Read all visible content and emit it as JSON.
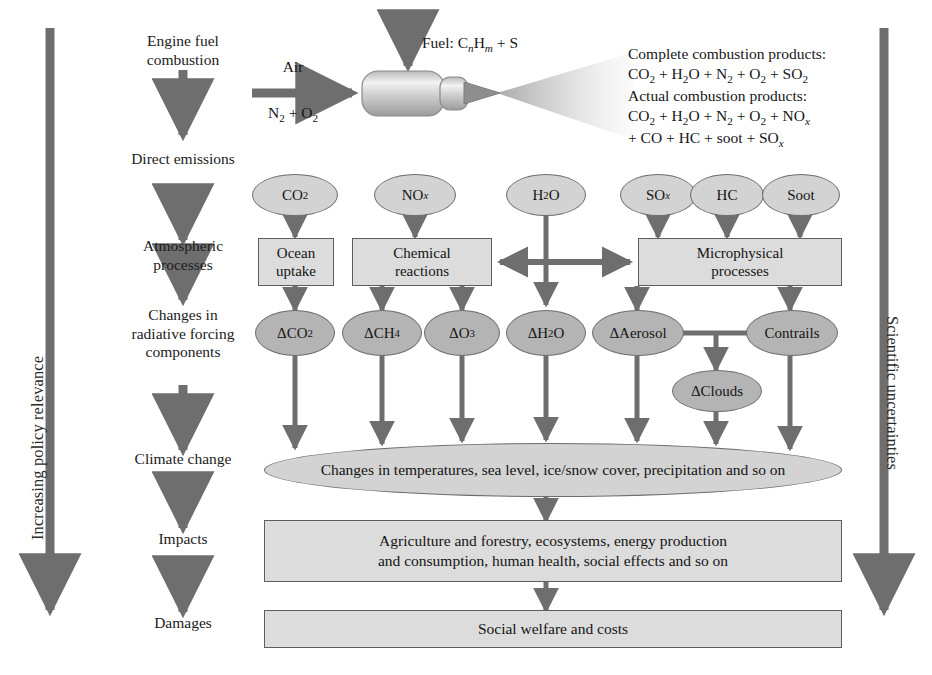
{
  "diagram": {
    "title_rails": {
      "left": "Increasing policy relevance",
      "right": "Scientific uncertainties"
    },
    "stages": [
      {
        "id": "engine-fuel-combustion",
        "label": "Engine fuel\ncombustion"
      },
      {
        "id": "direct-emissions",
        "label": "Direct emissions"
      },
      {
        "id": "atmospheric-processes",
        "label": "Atmospheric\nprocesses"
      },
      {
        "id": "radiative-forcing",
        "label": "Changes in\nradiative forcing\ncomponents"
      },
      {
        "id": "climate-change",
        "label": "Climate change"
      },
      {
        "id": "impacts",
        "label": "Impacts"
      },
      {
        "id": "damages",
        "label": "Damages"
      }
    ],
    "engine": {
      "air_label_top": "Air",
      "air_label_bottom": "N₂ + O₂",
      "fuel_label": "Fuel: CnHm + S",
      "fuel_label_parts": {
        "prefix": "Fuel: C",
        "sub1": "n",
        "mid": "H",
        "sub2": "m",
        "suffix": " + S"
      }
    },
    "combustion_products": {
      "complete_heading": "Complete combustion products:",
      "complete_formula": "CO₂ + H₂O + N₂ + O₂ + SO₂",
      "actual_heading": "Actual combustion products:",
      "actual_formula_line1": "CO₂ + H₂O + N₂ + O₂ + NOx",
      "actual_formula_line2": "+ CO + HC + soot + SOx"
    },
    "emissions": [
      {
        "id": "co2",
        "label": "CO₂"
      },
      {
        "id": "nox",
        "label": "NOx"
      },
      {
        "id": "h2o",
        "label": "H₂O"
      },
      {
        "id": "sox",
        "label": "SOx"
      },
      {
        "id": "hc",
        "label": "HC"
      },
      {
        "id": "soot",
        "label": "Soot"
      }
    ],
    "processes": [
      {
        "id": "ocean-uptake",
        "label": "Ocean\nuptake"
      },
      {
        "id": "chemical-reactions",
        "label": "Chemical\nreactions"
      },
      {
        "id": "microphysical-processes",
        "label": "Microphysical\nprocesses"
      }
    ],
    "forcing_components": [
      {
        "id": "d-co2",
        "label": "ΔCO₂"
      },
      {
        "id": "d-ch4",
        "label": "ΔCH₄"
      },
      {
        "id": "d-o3",
        "label": "ΔO₃"
      },
      {
        "id": "d-h2o",
        "label": "ΔH₂O"
      },
      {
        "id": "d-aerosol",
        "label": "ΔAerosol"
      },
      {
        "id": "contrails",
        "label": "Contrails"
      },
      {
        "id": "d-clouds",
        "label": "ΔClouds"
      }
    ],
    "climate_change_text": "Changes in temperatures, sea level, ice/snow cover, precipitation and so on",
    "impacts_text": "Agriculture and forestry, ecosystems, energy production\nand consumption, human health, social effects and so on",
    "damages_text": "Social welfare and costs",
    "colors": {
      "arrow_gray": "#6e6e6e",
      "node_light": "#d3d3d3",
      "node_dark": "#b4b4b4",
      "box_fill": "#dcdcdc",
      "border": "#5d5d5d",
      "text": "#161616"
    }
  }
}
